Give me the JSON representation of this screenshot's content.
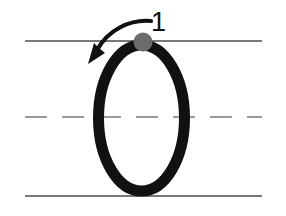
{
  "worksheet": {
    "title": "Letter formation guide",
    "letter": "O",
    "background_color": "#ffffff",
    "width": 286,
    "height": 216
  },
  "guidelines": {
    "top": {
      "label": "top-line",
      "y": 41,
      "x_start": 25,
      "x_end": 262,
      "style": "solid",
      "color": "#4d4d4d"
    },
    "middle": {
      "label": "midline",
      "y": 117,
      "x_start": 25,
      "x_end": 262,
      "style": "dashed",
      "color": "#7a7a7a"
    },
    "bottom": {
      "label": "baseline",
      "y": 196,
      "x_start": 25,
      "x_end": 262,
      "style": "solid",
      "color": "#4d4d4d"
    }
  },
  "letter_shape": {
    "name": "oval-letter-o",
    "center_x": 141.5,
    "center_y": 118,
    "radius_x": 43,
    "radius_y": 73,
    "stroke_color": "#111111",
    "stroke_width": 11
  },
  "start_marker": {
    "name": "start-dot",
    "cx": 143,
    "cy": 42,
    "r": 9.5,
    "color": "#6b6b6b"
  },
  "stroke_arrow": {
    "name": "direction-arrow",
    "direction": "counterclockwise",
    "color": "#111111",
    "path": "M 151 21 C 130 19 108 30 97 50",
    "head_points": "88,64 105,53 99,48 94,43"
  },
  "stroke_order": {
    "number": "1",
    "x": 151,
    "y": 31,
    "color": "#111111"
  }
}
